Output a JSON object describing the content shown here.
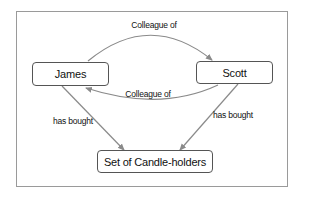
{
  "diagram": {
    "type": "relationship-graph",
    "nodes": [
      {
        "id": "james",
        "label": "James"
      },
      {
        "id": "scott",
        "label": "Scott"
      },
      {
        "id": "candles",
        "label": "Set of Candle-holders"
      }
    ],
    "edges": [
      {
        "from": "james",
        "to": "scott",
        "label": "Colleague of"
      },
      {
        "from": "scott",
        "to": "james",
        "label": "Colleague of"
      },
      {
        "from": "james",
        "to": "candles",
        "label": "has bought"
      },
      {
        "from": "scott",
        "to": "candles",
        "label": "has bought"
      }
    ],
    "colors": {
      "edge": "#8a8a8a",
      "node_border": "#555555",
      "frame": "#9a9a9a"
    }
  }
}
